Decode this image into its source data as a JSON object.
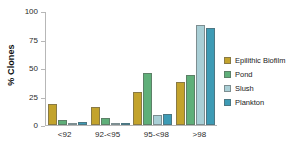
{
  "chart_data": {
    "type": "bar",
    "title": "",
    "xlabel": "",
    "ylabel": "% Clones",
    "ylim": [
      0,
      100
    ],
    "yticks": [
      0,
      25,
      50,
      75,
      100
    ],
    "grid": false,
    "legend_position": "right",
    "categories": [
      "<92",
      "92-<95",
      "95-<98",
      ">98"
    ],
    "series": [
      {
        "name": "Epilithic Biofilm",
        "color": "#C3A32C",
        "values": [
          18,
          16,
          29,
          38
        ]
      },
      {
        "name": "Pond",
        "color": "#5FAF79",
        "values": [
          4,
          6.5,
          46,
          44
        ]
      },
      {
        "name": "Slush",
        "color": "#A9CFD6",
        "values": [
          0.5,
          0.8,
          8.5,
          88
        ]
      },
      {
        "name": "Plankton",
        "color": "#3D9BB5",
        "values": [
          3,
          0.5,
          9.5,
          85
        ]
      }
    ]
  },
  "axis": {
    "y_title": "% Clones",
    "tick_labels": [
      "100",
      "75",
      "50",
      "25",
      "0"
    ],
    "tick_values": [
      100,
      75,
      50,
      25,
      0
    ]
  },
  "legend": {
    "items": [
      {
        "label": "Epilithic Biofilm",
        "color": "#C3A32C"
      },
      {
        "label": "Pond",
        "color": "#5FAF79"
      },
      {
        "label": "Slush",
        "color": "#A9CFD6"
      },
      {
        "label": "Plankton",
        "color": "#3D9BB5"
      }
    ]
  }
}
